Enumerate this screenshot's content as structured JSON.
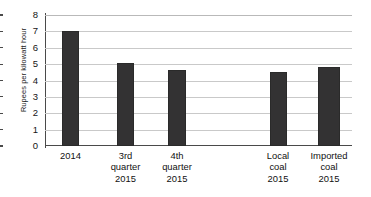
{
  "chart_data": {
    "type": "bar",
    "title": "",
    "subtitle": "",
    "xlabel": "",
    "ylabel": "Rupees per kilowatt hour",
    "ylim": [
      0,
      8
    ],
    "yticks": [
      "0",
      "1",
      "2",
      "3",
      "4",
      "5",
      "6",
      "7",
      "8"
    ],
    "grid": true,
    "legend": "none",
    "categories": [
      "2014",
      "3rd\nquarter\n2015",
      "4th\nquarter\n2015",
      "Local\ncoal\n2015",
      "Imported\ncoal\n2015"
    ],
    "values": [
      7.0,
      5.1,
      4.65,
      4.5,
      4.85
    ],
    "bar_color": "#333233",
    "gridline_color": "#c9c9c9",
    "axis_color": "#4a4a4a",
    "background_color": "#ffffff"
  }
}
